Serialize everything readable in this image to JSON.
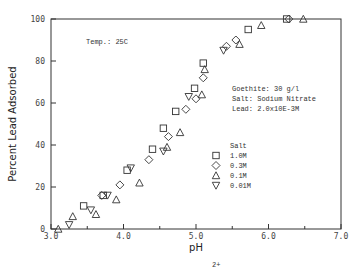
{
  "chart_data": {
    "type": "scatter",
    "title": "",
    "xlabel": "pH",
    "ylabel": "Percent Lead Adsorbed",
    "xlim": [
      3.0,
      7.0
    ],
    "ylim": [
      0,
      100
    ],
    "x_ticks": [
      "3.0",
      "4.0",
      "5.0",
      "6.0",
      "7.0"
    ],
    "y_ticks": [
      "0",
      "20",
      "40",
      "60",
      "80",
      "100"
    ],
    "grid": false,
    "legend_title": "Salt",
    "legend_position": "inside right",
    "annotations": {
      "temp": "Temp.: 25C",
      "goethite": "Goethite:  30 g/l",
      "salt": "Salt:  Sodium Nitrate",
      "lead": "Lead:  2.0x10E-3M"
    },
    "series": [
      {
        "name": "1.0M",
        "marker": "square",
        "points": [
          [
            3.45,
            11
          ],
          [
            3.72,
            16
          ],
          [
            4.05,
            28
          ],
          [
            4.4,
            38
          ],
          [
            4.55,
            48
          ],
          [
            4.72,
            56
          ],
          [
            4.98,
            67
          ],
          [
            5.1,
            79
          ],
          [
            5.72,
            95
          ],
          [
            6.25,
            100
          ]
        ]
      },
      {
        "name": "0.3M",
        "marker": "diamond",
        "points": [
          [
            3.7,
            16
          ],
          [
            3.95,
            21
          ],
          [
            4.35,
            33
          ],
          [
            4.62,
            44
          ],
          [
            4.86,
            57
          ],
          [
            5.0,
            62
          ],
          [
            5.1,
            72
          ],
          [
            5.42,
            87
          ],
          [
            5.55,
            90
          ],
          [
            6.28,
            100
          ]
        ]
      },
      {
        "name": "0.1M",
        "marker": "triangle-up",
        "points": [
          [
            3.1,
            0
          ],
          [
            3.3,
            6
          ],
          [
            3.62,
            7
          ],
          [
            3.9,
            14
          ],
          [
            4.22,
            22
          ],
          [
            4.6,
            39
          ],
          [
            4.78,
            46
          ],
          [
            5.08,
            64
          ],
          [
            5.12,
            76
          ],
          [
            5.6,
            88
          ],
          [
            5.9,
            97
          ],
          [
            6.48,
            100
          ]
        ]
      },
      {
        "name": "0.01M",
        "marker": "triangle-down",
        "points": [
          [
            3.25,
            2
          ],
          [
            3.55,
            9
          ],
          [
            3.78,
            16
          ],
          [
            4.1,
            29
          ],
          [
            4.55,
            37
          ],
          [
            4.9,
            63
          ],
          [
            5.38,
            85
          ]
        ]
      }
    ]
  },
  "footer_fragment": "2+"
}
